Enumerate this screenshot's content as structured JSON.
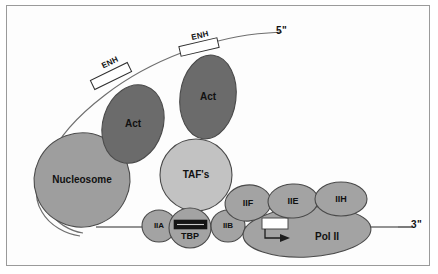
{
  "figure": {
    "frame_color": "#9a9a9a",
    "background": "#fdfdfd"
  },
  "colors": {
    "dna_line": "#6f6f6f",
    "activator_fill": "#6b6b6b",
    "nucleosome_fill": "#9e9e9e",
    "taf_fill": "#c2c2c2",
    "factor_fill": "#a3a3a3",
    "polymerase_fill": "#a3a3a3",
    "tata_fill": "#141414",
    "outline": "#4a4a4a",
    "text": "#111111",
    "enh_box_fill": "#ffffff"
  },
  "dna": {
    "five_prime_label": "5\"",
    "three_prime_label": "3\"",
    "enhancer_label": "ENH",
    "enhancers": [
      {
        "id": "enh-distal",
        "label": "ENH"
      },
      {
        "id": "enh-proximal",
        "label": "ENH"
      }
    ]
  },
  "complexes": {
    "nucleosome": {
      "label": "Nucleosome"
    },
    "activators": [
      {
        "id": "act-1",
        "label": "Act"
      },
      {
        "id": "act-2",
        "label": "Act"
      }
    ],
    "tafs": {
      "label": "TAF's"
    },
    "tbp": {
      "label": "TBP"
    },
    "general_factors": [
      {
        "id": "tfiia",
        "label": "IIA"
      },
      {
        "id": "tfiib",
        "label": "IIB"
      },
      {
        "id": "tfiif",
        "label": "IIF"
      },
      {
        "id": "tfiie",
        "label": "IIE"
      },
      {
        "id": "tfiih",
        "label": "IIH"
      }
    ],
    "polymerase": {
      "label": "Pol II"
    }
  }
}
